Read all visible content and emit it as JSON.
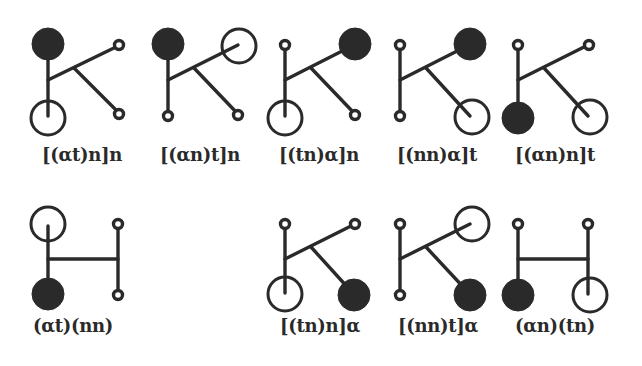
{
  "figure": {
    "diagrams": [
      {
        "id": 1,
        "shape": "K",
        "label": "[(αt)n]n",
        "nodes": {
          "top_left": "filled",
          "bottom_left": "open",
          "top_right": "small",
          "bottom_right": "small"
        }
      },
      {
        "id": 2,
        "shape": "K",
        "label": "[(αn)t]n",
        "nodes": {
          "top_left": "filled",
          "bottom_left": "small",
          "top_right": "open",
          "bottom_right": "small"
        }
      },
      {
        "id": 3,
        "shape": "K",
        "label": "[(tn)α]n",
        "nodes": {
          "top_left": "small",
          "bottom_left": "open",
          "top_right": "filled",
          "bottom_right": "small"
        }
      },
      {
        "id": 4,
        "shape": "K",
        "label": "[(nn)α]t",
        "nodes": {
          "top_left": "small",
          "bottom_left": "small",
          "top_right": "filled",
          "bottom_right": "open"
        }
      },
      {
        "id": 5,
        "shape": "K",
        "label": "[(αn)n]t",
        "nodes": {
          "top_left": "small",
          "bottom_left": "filled",
          "top_right": "small",
          "bottom_right": "open"
        }
      },
      {
        "id": 6,
        "shape": "H",
        "label": "(αt)(nn)",
        "nodes": {
          "top_left": "open",
          "bottom_left": "filled",
          "top_right": "small",
          "bottom_right": "small"
        }
      },
      {
        "id": 7,
        "shape": "K",
        "label": "[(tn)n]α",
        "nodes": {
          "top_left": "small",
          "bottom_left": "open",
          "top_right": "small",
          "bottom_right": "filled"
        }
      },
      {
        "id": 8,
        "shape": "K",
        "label": "[(nn)t]α",
        "nodes": {
          "top_left": "small",
          "bottom_left": "small",
          "top_right": "open",
          "bottom_right": "filled"
        }
      },
      {
        "id": 9,
        "shape": "H",
        "label": "(αn)(tn)",
        "nodes": {
          "top_left": "small",
          "bottom_left": "filled",
          "top_right": "small",
          "bottom_right": "open"
        }
      }
    ],
    "legend": {
      "filled": "α (filled circle)",
      "open": "t (open circle)",
      "small": "n (small circle)"
    },
    "colors": {
      "ink": "#2a2a2a",
      "background": "#ffffff"
    }
  }
}
